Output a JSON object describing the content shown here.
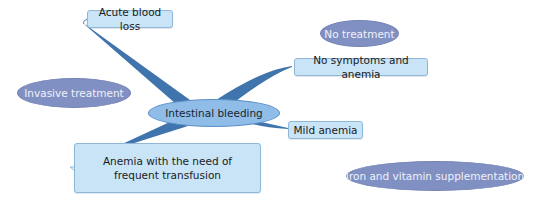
{
  "diagram": {
    "type": "mind-map",
    "center": {
      "label": "Intestinal bleeding"
    },
    "branches": [
      {
        "label": "Acute blood loss"
      },
      {
        "label": "No symptoms and anemia"
      },
      {
        "label": "Mild anemia"
      },
      {
        "label": "Anemia with the need of frequent transfusion"
      }
    ],
    "floating_topics": [
      {
        "label": "No treatment"
      },
      {
        "label": "Invasive treatment"
      },
      {
        "label": "Iron and vitamin supplementation"
      }
    ],
    "colors": {
      "branch_line": "#3f74ad",
      "topic_fill": "#c9e4f6",
      "topic_border": "#8fb7d8",
      "center_fill": "#8fbde8",
      "center_border": "#5c8fc6",
      "floating_fill": "#8190c2",
      "floating_text": "#eef0fa"
    }
  }
}
